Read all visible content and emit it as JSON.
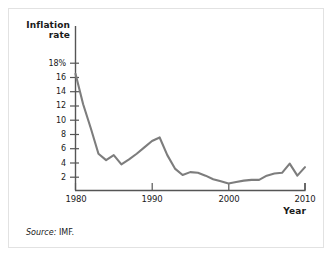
{
  "figure": {
    "source_prefix": "Source:",
    "source_value": "IMF.",
    "line_color": "#7d7d7d",
    "axis_color": "#555555",
    "text_color": "#1a1a1a",
    "background": "#ffffff",
    "border_color": "#e2e2e2"
  },
  "chart_data": {
    "type": "line",
    "title": "",
    "xlabel": "Year",
    "ylabel": "Inflation rate",
    "ylabel_lines": [
      "Inflation",
      "rate"
    ],
    "grid": false,
    "legend": "none",
    "xlim": [
      1980,
      2010
    ],
    "ylim": [
      0,
      18
    ],
    "xticks": [
      1980,
      1990,
      2000,
      2010
    ],
    "xtick_labels": [
      "1980",
      "1990",
      "2000",
      "2010"
    ],
    "yticks": [
      2,
      4,
      6,
      8,
      10,
      12,
      14,
      16,
      18
    ],
    "ytick_labels": [
      "2",
      "4",
      "6",
      "8",
      "10",
      "12",
      "14",
      "16",
      "18%"
    ],
    "series": [
      {
        "name": "Inflation rate",
        "color": "#7d7d7d",
        "x": [
          1980,
          1981,
          1982,
          1983,
          1984,
          1985,
          1986,
          1987,
          1988,
          1989,
          1990,
          1991,
          1992,
          1993,
          1994,
          1995,
          1996,
          1997,
          1998,
          1999,
          2000,
          2001,
          2002,
          2003,
          2004,
          2005,
          2006,
          2007,
          2008,
          2009,
          2010
        ],
        "values": [
          16.5,
          12.2,
          8.8,
          5.2,
          4.3,
          5.0,
          3.7,
          4.4,
          5.2,
          6.1,
          7.0,
          7.5,
          5.0,
          3.1,
          2.2,
          2.6,
          2.5,
          2.1,
          1.6,
          1.3,
          1.0,
          1.2,
          1.4,
          1.5,
          1.5,
          2.1,
          2.4,
          2.5,
          3.8,
          2.1,
          3.3
        ]
      }
    ]
  }
}
